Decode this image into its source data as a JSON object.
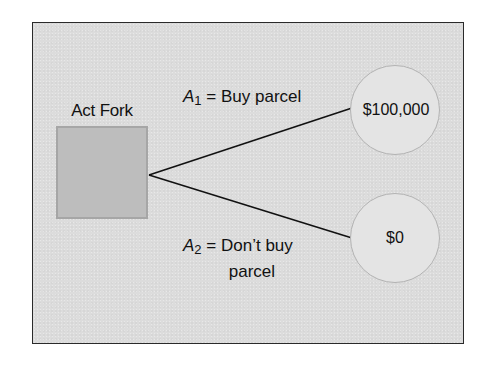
{
  "diagram": {
    "type": "decision-tree",
    "decision_node": {
      "label": "Act Fork",
      "shape": "square",
      "fill": "#bdbdbd"
    },
    "branches": [
      {
        "variable": "A",
        "subscript": "1",
        "equals": "=",
        "action": "Buy parcel",
        "action_line1": "Buy parcel",
        "action_line2": "",
        "outcome": "$100,000"
      },
      {
        "variable": "A",
        "subscript": "2",
        "equals": "=",
        "action": "Don’t buy parcel",
        "action_line1": "Don’t buy",
        "action_line2": "parcel",
        "outcome": "$0"
      }
    ],
    "colors": {
      "panel_background": "#dcdcdc",
      "panel_border": "#2a2a2a",
      "outcome_fill": "#e4e4e4",
      "line": "#111111"
    }
  }
}
